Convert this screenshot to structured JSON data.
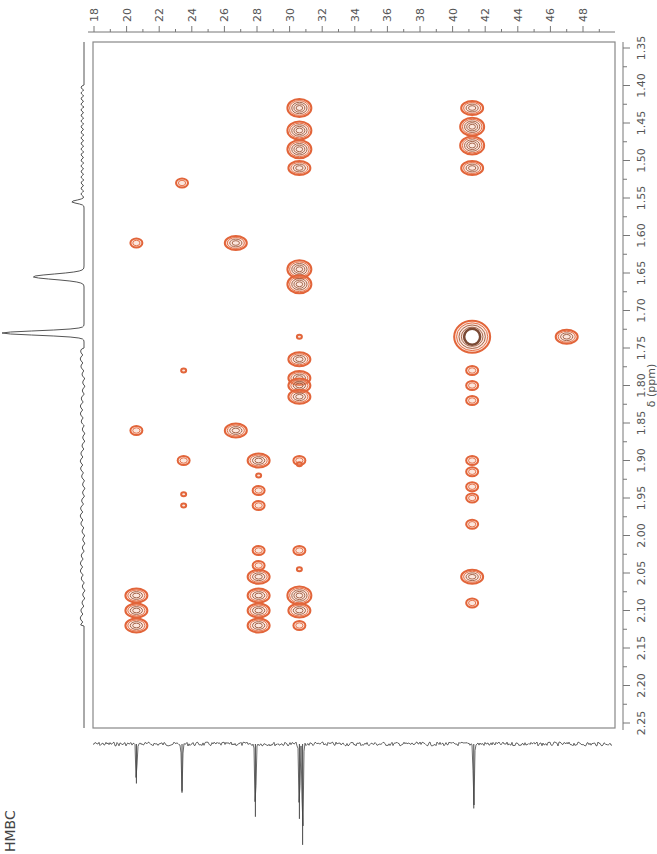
{
  "chart_data": {
    "type": "heatmap",
    "subtype": "2D NMR contour plot (HMBC), rotated 90 degrees",
    "title": "HMBC",
    "xlabel": "δ (ppm)",
    "x_axis": {
      "nucleus": "1H",
      "label": "δ (ppm)",
      "range": [
        1.35,
        2.25
      ],
      "ticks": [
        "1.35",
        "1.40",
        "1.45",
        "1.50",
        "1.55",
        "1.60",
        "1.65",
        "1.70",
        "1.75",
        "1.80",
        "1.85",
        "1.90",
        "1.95",
        "2.00",
        "2.05",
        "2.10",
        "2.15",
        "2.20",
        "2.25"
      ]
    },
    "y_axis": {
      "nucleus": "13C",
      "label": "",
      "range": [
        18,
        49
      ],
      "ticks": [
        "18",
        "20",
        "22",
        "24",
        "26",
        "28",
        "30",
        "32",
        "34",
        "36",
        "38",
        "40",
        "42",
        "44",
        "46",
        "48"
      ]
    },
    "grid": false,
    "contour_color": "#e2653a",
    "projection_1h": {
      "peaks": [
        {
          "shift": 1.555,
          "height": 0.15
        },
        {
          "shift": 1.655,
          "height": 0.62
        },
        {
          "shift": 1.73,
          "height": 1.0
        }
      ]
    },
    "projection_13c": {
      "peaks": [
        {
          "shift": 20.6,
          "height": 0.38
        },
        {
          "shift": 23.4,
          "height": 0.45
        },
        {
          "shift": 27.9,
          "height": 0.7
        },
        {
          "shift": 30.6,
          "height": 0.72
        },
        {
          "shift": 30.8,
          "height": 0.97
        },
        {
          "shift": 41.3,
          "height": 0.62
        }
      ]
    },
    "cross_peaks": [
      {
        "h": 1.43,
        "c": 30.6,
        "size": "large"
      },
      {
        "h": 1.46,
        "c": 30.6,
        "size": "large"
      },
      {
        "h": 1.485,
        "c": 30.6,
        "size": "large"
      },
      {
        "h": 1.51,
        "c": 30.6,
        "size": "medium"
      },
      {
        "h": 1.43,
        "c": 41.2,
        "size": "medium"
      },
      {
        "h": 1.455,
        "c": 41.2,
        "size": "large"
      },
      {
        "h": 1.48,
        "c": 41.2,
        "size": "large"
      },
      {
        "h": 1.51,
        "c": 41.2,
        "size": "medium"
      },
      {
        "h": 1.53,
        "c": 23.4,
        "size": "small"
      },
      {
        "h": 1.61,
        "c": 20.6,
        "size": "small"
      },
      {
        "h": 1.61,
        "c": 26.7,
        "size": "medium"
      },
      {
        "h": 1.645,
        "c": 30.6,
        "size": "large"
      },
      {
        "h": 1.665,
        "c": 30.6,
        "size": "large"
      },
      {
        "h": 1.735,
        "c": 41.2,
        "size": "very-large"
      },
      {
        "h": 1.735,
        "c": 47.0,
        "size": "medium"
      },
      {
        "h": 1.735,
        "c": 30.6,
        "size": "tiny"
      },
      {
        "h": 1.765,
        "c": 30.6,
        "size": "medium"
      },
      {
        "h": 1.79,
        "c": 30.6,
        "size": "medium"
      },
      {
        "h": 1.8,
        "c": 30.6,
        "size": "medium"
      },
      {
        "h": 1.815,
        "c": 30.6,
        "size": "medium"
      },
      {
        "h": 1.78,
        "c": 41.2,
        "size": "small"
      },
      {
        "h": 1.8,
        "c": 41.2,
        "size": "small"
      },
      {
        "h": 1.82,
        "c": 41.2,
        "size": "small"
      },
      {
        "h": 1.78,
        "c": 23.5,
        "size": "tiny"
      },
      {
        "h": 1.86,
        "c": 20.6,
        "size": "small"
      },
      {
        "h": 1.86,
        "c": 26.7,
        "size": "medium"
      },
      {
        "h": 1.9,
        "c": 23.5,
        "size": "small"
      },
      {
        "h": 1.9,
        "c": 28.1,
        "size": "medium"
      },
      {
        "h": 1.9,
        "c": 30.6,
        "size": "small"
      },
      {
        "h": 1.92,
        "c": 28.1,
        "size": "tiny"
      },
      {
        "h": 1.94,
        "c": 28.1,
        "size": "small"
      },
      {
        "h": 1.96,
        "c": 28.1,
        "size": "small"
      },
      {
        "h": 1.905,
        "c": 30.6,
        "size": "tiny"
      },
      {
        "h": 1.9,
        "c": 41.2,
        "size": "small"
      },
      {
        "h": 1.915,
        "c": 41.2,
        "size": "small"
      },
      {
        "h": 1.935,
        "c": 41.2,
        "size": "small"
      },
      {
        "h": 1.95,
        "c": 41.2,
        "size": "small"
      },
      {
        "h": 1.985,
        "c": 41.2,
        "size": "small"
      },
      {
        "h": 1.945,
        "c": 23.5,
        "size": "tiny"
      },
      {
        "h": 1.96,
        "c": 23.5,
        "size": "tiny"
      },
      {
        "h": 2.02,
        "c": 28.1,
        "size": "small"
      },
      {
        "h": 2.02,
        "c": 30.6,
        "size": "small"
      },
      {
        "h": 2.04,
        "c": 28.1,
        "size": "small"
      },
      {
        "h": 2.055,
        "c": 28.1,
        "size": "medium"
      },
      {
        "h": 2.055,
        "c": 41.2,
        "size": "medium"
      },
      {
        "h": 2.045,
        "c": 30.6,
        "size": "tiny"
      },
      {
        "h": 2.08,
        "c": 20.6,
        "size": "medium"
      },
      {
        "h": 2.08,
        "c": 28.1,
        "size": "medium"
      },
      {
        "h": 2.08,
        "c": 30.6,
        "size": "large"
      },
      {
        "h": 2.09,
        "c": 41.2,
        "size": "small"
      },
      {
        "h": 2.1,
        "c": 20.6,
        "size": "medium"
      },
      {
        "h": 2.12,
        "c": 20.6,
        "size": "medium"
      },
      {
        "h": 2.1,
        "c": 28.1,
        "size": "medium"
      },
      {
        "h": 2.12,
        "c": 28.1,
        "size": "medium"
      },
      {
        "h": 2.1,
        "c": 30.6,
        "size": "medium"
      },
      {
        "h": 2.12,
        "c": 30.6,
        "size": "small"
      }
    ]
  },
  "label": {
    "experiment": "HMBC"
  },
  "axes": {
    "h_axis_title": "δ (ppm)"
  }
}
